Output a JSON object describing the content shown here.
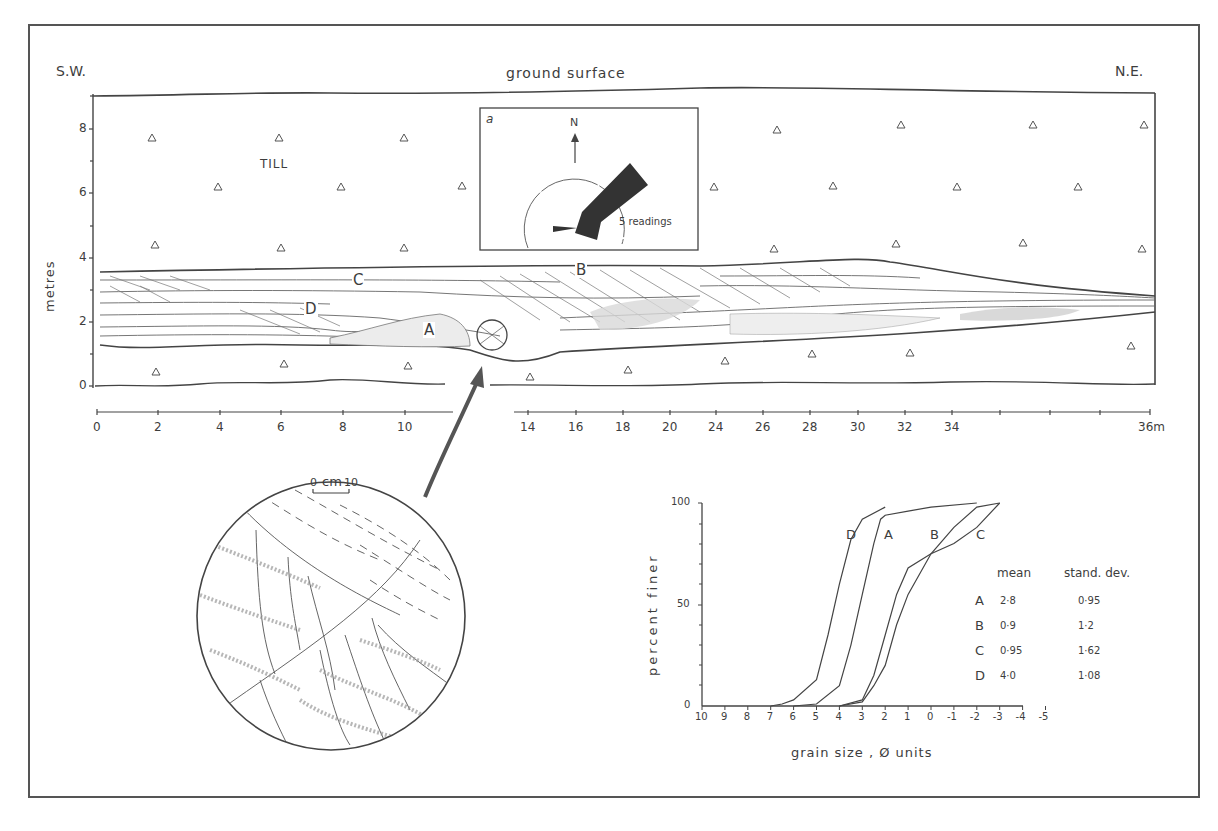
{
  "caption_partial": "...g ... p ... y ...",
  "section": {
    "left_label": "S.W.",
    "right_label": "N.E.",
    "ground_label": "ground surface",
    "till_label": "TILL",
    "y_axis_label": "metres",
    "y_ticks": [
      "0",
      "2",
      "4",
      "6",
      "8"
    ],
    "x_ticks": [
      "0",
      "2",
      "4",
      "6",
      "8",
      "10",
      "14",
      "16",
      "18",
      "20",
      "24",
      "26",
      "28",
      "30",
      "32",
      "34",
      "36m"
    ],
    "units": {
      "A": "A",
      "B": "B",
      "C": "C",
      "D": "D"
    }
  },
  "rose_inset": {
    "label": "a",
    "north": "N",
    "scale_text": "5 readings"
  },
  "detail_inset": {
    "scale_zero": "0",
    "scale_unit": "cm",
    "scale_max": "10"
  },
  "chart_data": {
    "type": "line",
    "title": "",
    "xlabel": "grain size , Ø units",
    "ylabel": "percent finer",
    "x_ticks": [
      "10",
      "9",
      "8",
      "7",
      "6",
      "5",
      "4",
      "3",
      "2",
      "1",
      "0",
      "-1",
      "-2",
      "-3",
      "-4",
      "-5"
    ],
    "y_ticks": [
      "0",
      "50",
      "100"
    ],
    "xlim": [
      10,
      -5
    ],
    "ylim": [
      0,
      100
    ],
    "grid": false,
    "series": [
      {
        "name": "D",
        "x": [
          7,
          6.5,
          6,
          5,
          4.5,
          4,
          3.5,
          3,
          2
        ],
        "y": [
          0,
          1,
          3,
          13,
          35,
          60,
          82,
          92,
          98
        ]
      },
      {
        "name": "A",
        "x": [
          6,
          5,
          4,
          3.5,
          3,
          2.5,
          2.2,
          2,
          1,
          0,
          -2
        ],
        "y": [
          0,
          1,
          10,
          30,
          55,
          80,
          92,
          94,
          96,
          98,
          100
        ]
      },
      {
        "name": "B",
        "x": [
          4,
          3,
          2.5,
          2,
          1.5,
          1,
          0,
          -1,
          -2,
          -3
        ],
        "y": [
          0,
          2,
          10,
          20,
          40,
          55,
          75,
          88,
          98,
          100
        ]
      },
      {
        "name": "C",
        "x": [
          4,
          3,
          2.5,
          2,
          1.5,
          1,
          0,
          -1,
          -2,
          -3
        ],
        "y": [
          0,
          3,
          15,
          35,
          55,
          68,
          75,
          80,
          88,
          100
        ]
      }
    ],
    "legend_table": {
      "headers": [
        "",
        "mean",
        "stand. dev."
      ],
      "rows": [
        {
          "unit": "A",
          "mean": "2·8",
          "sd": "0·95"
        },
        {
          "unit": "B",
          "mean": "0·9",
          "sd": "1·2"
        },
        {
          "unit": "C",
          "mean": "0·95",
          "sd": "1·62"
        },
        {
          "unit": "D",
          "mean": "4·0",
          "sd": "1·08"
        }
      ]
    }
  },
  "colors": {
    "ink": "#3a3a3a",
    "paper": "#ffffff",
    "shade": "#555555"
  }
}
